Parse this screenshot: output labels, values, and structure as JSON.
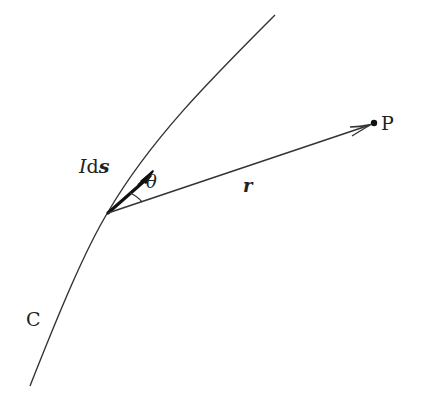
{
  "diagram": {
    "type": "physics-biot-savart",
    "curve_label": "C",
    "current_element_label_italic": "I",
    "current_element_label_d": "d",
    "current_element_label_bold": "s",
    "angle_label": "θ",
    "vector_label": "r",
    "point_label": "P",
    "colors": {
      "stroke": "#222222",
      "background": "#ffffff"
    }
  }
}
